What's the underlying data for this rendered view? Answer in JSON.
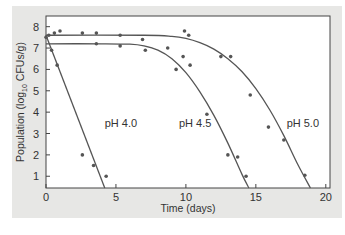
{
  "chart_data": {
    "type": "scatter",
    "title": "",
    "xlabel": "Time (days)",
    "ylabel": "Population (log10 CFUs/g)",
    "ylabel_parts": {
      "prefix": "Population (log",
      "sub": "10",
      "suffix": " CFUs/g)"
    },
    "xlim": [
      0,
      20.3
    ],
    "ylim": [
      0.45,
      8.5
    ],
    "xticks": [
      0,
      5,
      10,
      15,
      20
    ],
    "yticks": [
      1,
      2,
      3,
      4,
      5,
      6,
      7,
      8
    ],
    "grid": false,
    "legend": "inline labels",
    "series": [
      {
        "name": "pH 4.0",
        "label_pos": [
          4.2,
          3.3
        ],
        "points": [
          [
            0.0,
            7.5
          ],
          [
            0.4,
            6.9
          ],
          [
            0.8,
            6.2
          ],
          [
            2.6,
            2.0
          ],
          [
            3.4,
            1.5
          ],
          [
            4.3,
            1.0
          ]
        ],
        "fit_curve": [
          [
            0.0,
            7.6
          ],
          [
            4.2,
            0.45
          ]
        ]
      },
      {
        "name": "pH 4.5",
        "label_pos": [
          9.5,
          3.3
        ],
        "points": [
          [
            3.6,
            7.2
          ],
          [
            5.3,
            7.1
          ],
          [
            7.1,
            6.9
          ],
          [
            8.7,
            7.0
          ],
          [
            9.3,
            6.0
          ],
          [
            9.8,
            6.6
          ],
          [
            10.3,
            6.2
          ],
          [
            11.5,
            3.9
          ],
          [
            13.0,
            2.0
          ],
          [
            13.7,
            1.9
          ],
          [
            14.3,
            1.0
          ]
        ],
        "fit_curve": [
          [
            0,
            7.2
          ],
          [
            4,
            7.2
          ],
          [
            6,
            7.18
          ],
          [
            7,
            7.1
          ],
          [
            8,
            6.9
          ],
          [
            9,
            6.5
          ],
          [
            10,
            5.85
          ],
          [
            11,
            4.95
          ],
          [
            12,
            3.85
          ],
          [
            13,
            2.55
          ],
          [
            14,
            1.1
          ],
          [
            14.5,
            0.45
          ]
        ]
      },
      {
        "name": "pH 5.0",
        "label_pos": [
          17.2,
          3.3
        ],
        "points": [
          [
            0.2,
            7.6
          ],
          [
            0.6,
            7.7
          ],
          [
            1.0,
            7.8
          ],
          [
            2.6,
            7.7
          ],
          [
            3.6,
            7.7
          ],
          [
            5.3,
            7.6
          ],
          [
            6.9,
            7.4
          ],
          [
            9.9,
            7.8
          ],
          [
            10.2,
            7.6
          ],
          [
            12.5,
            6.6
          ],
          [
            13.2,
            6.6
          ],
          [
            14.6,
            4.8
          ],
          [
            15.9,
            3.3
          ],
          [
            17.0,
            2.7
          ],
          [
            18.5,
            1.05
          ]
        ],
        "fit_curve": [
          [
            0,
            7.6
          ],
          [
            7,
            7.6
          ],
          [
            9,
            7.55
          ],
          [
            10,
            7.45
          ],
          [
            11,
            7.25
          ],
          [
            12,
            6.95
          ],
          [
            13,
            6.5
          ],
          [
            14,
            5.9
          ],
          [
            15,
            5.1
          ],
          [
            16,
            4.1
          ],
          [
            17,
            2.9
          ],
          [
            18,
            1.55
          ],
          [
            18.9,
            0.45
          ]
        ]
      }
    ]
  }
}
